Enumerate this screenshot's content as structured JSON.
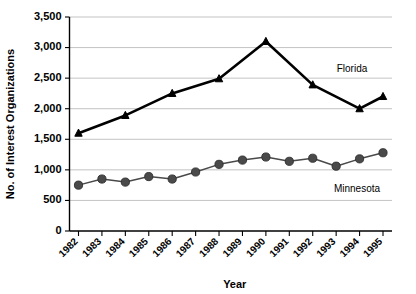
{
  "chart_data": {
    "type": "line",
    "title": "",
    "xlabel": "Year",
    "ylabel": "No. of Interest Organizations",
    "categories": [
      "1982",
      "1983",
      "1984",
      "1985",
      "1986",
      "1987",
      "1988",
      "1989",
      "1990",
      "1991",
      "1992",
      "1993",
      "1994",
      "1995"
    ],
    "x": [
      1982,
      1983,
      1984,
      1985,
      1986,
      1987,
      1988,
      1989,
      1990,
      1991,
      1992,
      1993,
      1994,
      1995
    ],
    "series": [
      {
        "name": "Florida",
        "marker": "triangle",
        "color": "#000000",
        "line_width": 2.6,
        "label_position": "upper-right",
        "x": [
          1982,
          1984,
          1986,
          1988,
          1990,
          1992,
          1994,
          1995
        ],
        "values": [
          1600,
          1890,
          2250,
          2490,
          3100,
          2390,
          2000,
          2200
        ]
      },
      {
        "name": "Minnesota",
        "marker": "circle",
        "color": "#4a4a4a",
        "line_width": 1.5,
        "label_position": "lower-right",
        "x": [
          1982,
          1983,
          1984,
          1985,
          1986,
          1987,
          1988,
          1989,
          1990,
          1991,
          1992,
          1993,
          1994,
          1995
        ],
        "values": [
          750,
          850,
          800,
          890,
          850,
          965,
          1090,
          1160,
          1210,
          1140,
          1190,
          1060,
          1180,
          1280
        ]
      }
    ],
    "ylim": [
      0,
      3500
    ],
    "ytick_values": [
      0,
      500,
      1000,
      1500,
      2000,
      2500,
      3000,
      3500
    ],
    "ytick_labels": [
      "0",
      "500",
      "1,000",
      "1,500",
      "2,000",
      "2,500",
      "3,000",
      "3,500"
    ],
    "grid": true,
    "grid_axis": "y",
    "legend": "inline-labels",
    "legend_position": "inside-right",
    "xtick_rotation": 45
  },
  "axes": {
    "y_title": "No. of Interest Organizations",
    "x_title": "Year"
  },
  "colors": {
    "florida": "#000000",
    "minnesota": "#4a4a4a",
    "gridline": "#b4b4b4",
    "axis": "#000000",
    "background": "#ffffff"
  }
}
